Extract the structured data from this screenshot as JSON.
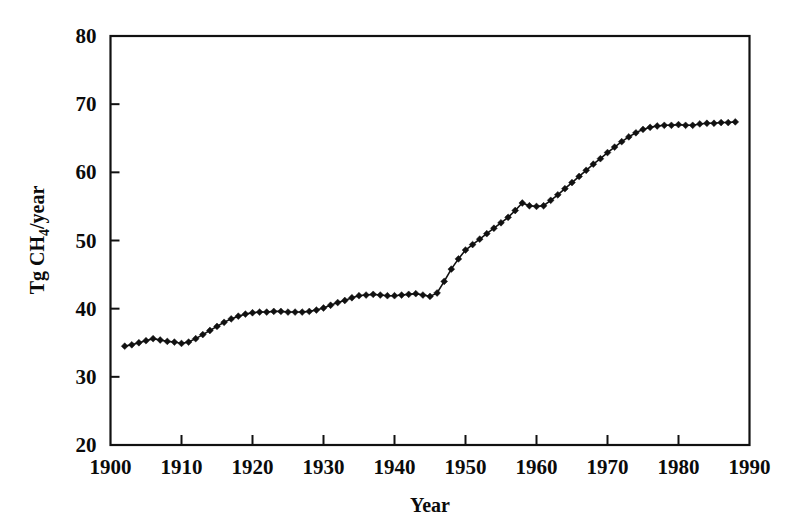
{
  "chart_data": {
    "type": "line",
    "title": "",
    "xlabel": "Year",
    "ylabel": "Tg CH4/year",
    "ylabel_parts": {
      "prefix": "Tg CH",
      "subscript": "4",
      "suffix": "/year"
    },
    "xlim": [
      1900,
      1990
    ],
    "ylim": [
      20,
      80
    ],
    "xticks": [
      1900,
      1910,
      1920,
      1930,
      1940,
      1950,
      1960,
      1970,
      1980,
      1990
    ],
    "xtick_labels": [
      "1900",
      "1910",
      "1920",
      "1930",
      "1940",
      "1950",
      "1960",
      "1970",
      "1980",
      "1990"
    ],
    "yticks": [
      20,
      30,
      40,
      50,
      60,
      70,
      80
    ],
    "ytick_labels": [
      "20",
      "30",
      "40",
      "50",
      "60",
      "70",
      "80"
    ],
    "grid": false,
    "legend": null,
    "marker": "diamond",
    "line_color": "#111111",
    "marker_color": "#111111",
    "x": [
      1902,
      1903,
      1904,
      1905,
      1906,
      1907,
      1908,
      1909,
      1910,
      1911,
      1912,
      1913,
      1914,
      1915,
      1916,
      1917,
      1918,
      1919,
      1920,
      1921,
      1922,
      1923,
      1924,
      1925,
      1926,
      1927,
      1928,
      1929,
      1930,
      1931,
      1932,
      1933,
      1934,
      1935,
      1936,
      1937,
      1938,
      1939,
      1940,
      1941,
      1942,
      1943,
      1944,
      1945,
      1946,
      1947,
      1948,
      1949,
      1950,
      1951,
      1952,
      1953,
      1954,
      1955,
      1956,
      1957,
      1958,
      1959,
      1960,
      1961,
      1962,
      1963,
      1964,
      1965,
      1966,
      1967,
      1968,
      1969,
      1970,
      1971,
      1972,
      1973,
      1974,
      1975,
      1976,
      1977,
      1978,
      1979,
      1980,
      1981,
      1982,
      1983,
      1984,
      1985,
      1986,
      1987,
      1988
    ],
    "values": [
      34.5,
      34.7,
      35.0,
      35.3,
      35.6,
      35.4,
      35.2,
      35.1,
      34.9,
      35.1,
      35.6,
      36.2,
      36.8,
      37.4,
      38.0,
      38.5,
      38.9,
      39.2,
      39.4,
      39.5,
      39.5,
      39.6,
      39.6,
      39.5,
      39.5,
      39.5,
      39.6,
      39.8,
      40.1,
      40.5,
      40.9,
      41.2,
      41.6,
      41.9,
      42.0,
      42.1,
      42.0,
      41.9,
      41.9,
      42.0,
      42.1,
      42.2,
      42.0,
      41.8,
      42.3,
      44.0,
      45.8,
      47.3,
      48.6,
      49.4,
      50.2,
      51.0,
      51.8,
      52.6,
      53.4,
      54.4,
      55.5,
      55.1,
      55.0,
      55.1,
      55.9,
      56.7,
      57.6,
      58.5,
      59.4,
      60.3,
      61.2,
      62.0,
      62.9,
      63.7,
      64.5,
      65.2,
      65.8,
      66.3,
      66.6,
      66.8,
      66.9,
      66.9,
      67.0,
      66.9,
      66.9,
      67.1,
      67.2,
      67.2,
      67.3,
      67.3,
      67.4
    ]
  },
  "figure": {
    "background_color": "#ffffff",
    "frame_color": "#111111"
  }
}
